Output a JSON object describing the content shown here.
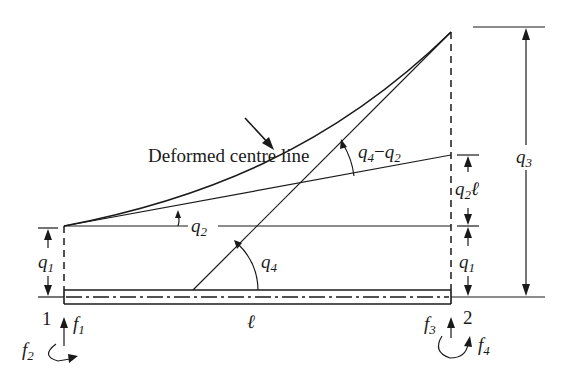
{
  "figure": {
    "callout": "Deformed centre line",
    "nodes": [
      {
        "id": "1",
        "force": "f",
        "force_sub": "1",
        "moment": "f",
        "moment_sub": "2"
      },
      {
        "id": "2",
        "force": "f",
        "force_sub": "3",
        "moment": "f",
        "moment_sub": "4"
      }
    ],
    "length_label": "ℓ",
    "dof_labels": {
      "q1_left": {
        "base": "q",
        "sub": "1"
      },
      "q1_right": {
        "base": "q",
        "sub": "1"
      },
      "q2_angle": {
        "base": "q",
        "sub": "2"
      },
      "q2l": {
        "base": "q",
        "sub": "2",
        "suffix": "ℓ"
      },
      "q3": {
        "base": "q",
        "sub": "3"
      },
      "q4_angle": {
        "base": "q",
        "sub": "4"
      },
      "q4_minus_q2": {
        "a_base": "q",
        "a_sub": "4",
        "op": "−",
        "b_base": "q",
        "b_sub": "2"
      }
    },
    "colors": {
      "ink": "#1a1a1a",
      "background": "#ffffff"
    }
  }
}
